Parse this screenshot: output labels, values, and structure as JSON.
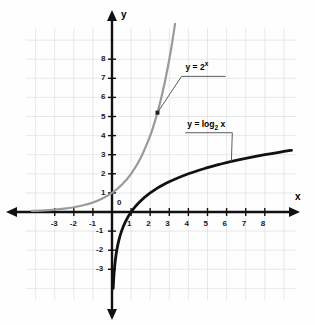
{
  "chart_data": {
    "type": "line",
    "title": "",
    "xlabel": "x",
    "ylabel": "y",
    "xlim": [
      -4.2,
      9.6
    ],
    "ylim": [
      -4.2,
      9.8
    ],
    "grid": true,
    "grid_color": "#e2e2e6",
    "background": "#fefefe",
    "legend": "inline-leader-labels",
    "origin_label": "0",
    "xticks": [
      -3,
      -2,
      -1,
      1,
      2,
      3,
      4,
      5,
      6,
      7,
      8
    ],
    "xtick_labels": [
      "-3",
      "-2",
      "-1",
      "1",
      "2",
      "3",
      "4",
      "5",
      "6",
      "7",
      "8"
    ],
    "yticks": [
      -3,
      -2,
      -1,
      1,
      2,
      3,
      4,
      5,
      6,
      7,
      8
    ],
    "ytick_labels": [
      "-3",
      "-2",
      "-1",
      "1",
      "2",
      "3",
      "4",
      "5",
      "6",
      "7",
      "8"
    ],
    "series": [
      {
        "name": "y = 2^x",
        "label_html": "y = 2<sup>x</sup>",
        "color": "#9a9a9a",
        "width": 2.2,
        "x": [
          -4.2,
          -3.5,
          -3,
          -2.5,
          -2,
          -1.5,
          -1,
          -0.5,
          0,
          0.5,
          1,
          1.5,
          2,
          2.25,
          2.5,
          2.75,
          3,
          3.15,
          3.3
        ],
        "y": [
          0.054,
          0.088,
          0.125,
          0.177,
          0.25,
          0.354,
          0.5,
          0.707,
          1,
          1.414,
          2,
          2.828,
          4,
          4.757,
          5.657,
          6.727,
          8,
          8.87,
          9.85
        ]
      },
      {
        "name": "y = log2 x",
        "label_html": "y = log<sub>2</sub> x",
        "color": "#111111",
        "width": 2.8,
        "x": [
          0.062,
          0.088,
          0.125,
          0.177,
          0.25,
          0.354,
          0.5,
          0.707,
          1,
          1.414,
          2,
          2.828,
          4,
          5,
          5.657,
          6.5,
          8,
          9,
          9.4
        ],
        "y": [
          -4.0,
          -3.5,
          -3,
          -2.5,
          -2,
          -1.5,
          -1,
          -0.5,
          0,
          0.5,
          1,
          1.5,
          2,
          2.322,
          2.5,
          2.7,
          3,
          3.17,
          3.23
        ]
      }
    ],
    "annotations": [
      {
        "text": "y = 2^x",
        "anchor_x": 2.38,
        "anchor_y": 5.2,
        "label_x": 3.85,
        "label_y": 7.1
      },
      {
        "text": "y = log2 x",
        "anchor_x": 6.25,
        "anchor_y": 2.64,
        "label_x": 4.1,
        "label_y": 4.15
      }
    ]
  },
  "axes": {
    "x_name": "x",
    "y_name": "y",
    "origin": "0"
  },
  "labels": {
    "exponential": "y = 2",
    "exponential_exp": "x",
    "logarithmic_pre": "y = log",
    "logarithmic_sub": "2",
    "logarithmic_post": " x"
  }
}
